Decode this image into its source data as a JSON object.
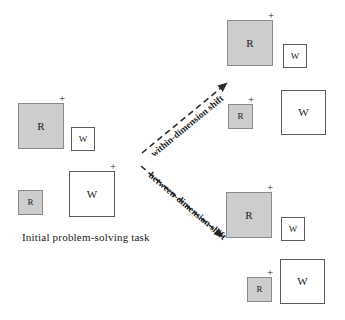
{
  "figure": {
    "width": 345,
    "height": 320,
    "background": "#ffffff",
    "fill_color": "#cdcdcd",
    "fill_border_color": "#8a8a8a",
    "open_border_color": "#5c5c5c",
    "arrow_color": "#2b2b2b"
  },
  "caption": {
    "initial_task": "Initial problem-solving task"
  },
  "arrows": {
    "within": {
      "label": "within-dimension shift",
      "x1": 142,
      "y1": 153,
      "x2": 227,
      "y2": 83,
      "label_x": 152,
      "label_y": 150,
      "label_angle": -39.5
    },
    "between": {
      "label": "between-dimension shift",
      "x1": 141,
      "y1": 166,
      "x2": 223,
      "y2": 237,
      "label_x": 150,
      "label_y": 169,
      "label_angle": 40.5
    }
  },
  "groups": [
    {
      "id": "initial-task",
      "name": "initial-problem-solving-task",
      "shapes": [
        {
          "id": "initial-large-r",
          "letter": "R",
          "fill": "filled",
          "size": "big",
          "x": 18,
          "y": 103,
          "w": 46,
          "h": 46,
          "plus": true,
          "plus_x": 59,
          "plus_y": 93
        },
        {
          "id": "initial-small-w",
          "letter": "W",
          "fill": "open",
          "size": "small",
          "x": 71,
          "y": 127,
          "w": 24,
          "h": 24,
          "plus": false,
          "plus_x": 0,
          "plus_y": 0
        },
        {
          "id": "initial-small-r",
          "letter": "R",
          "fill": "filled",
          "size": "small",
          "x": 18,
          "y": 190,
          "w": 25,
          "h": 25,
          "plus": false,
          "plus_x": 0,
          "plus_y": 0
        },
        {
          "id": "initial-large-w",
          "letter": "W",
          "fill": "open",
          "size": "big",
          "x": 69,
          "y": 171,
          "w": 46,
          "h": 46,
          "plus": true,
          "plus_x": 110,
          "plus_y": 161
        }
      ]
    },
    {
      "id": "within-shift",
      "name": "within-dimension-shift-outcome",
      "shapes": [
        {
          "id": "within-large-r",
          "letter": "R",
          "fill": "filled",
          "size": "big",
          "x": 227,
          "y": 20,
          "w": 46,
          "h": 46,
          "plus": true,
          "plus_x": 268,
          "plus_y": 10
        },
        {
          "id": "within-small-w",
          "letter": "W",
          "fill": "open",
          "size": "small",
          "x": 283,
          "y": 44,
          "w": 24,
          "h": 24,
          "plus": false,
          "plus_x": 0,
          "plus_y": 0
        },
        {
          "id": "within-small-r",
          "letter": "R",
          "fill": "filled",
          "size": "small",
          "x": 228,
          "y": 104,
          "w": 25,
          "h": 25,
          "plus": true,
          "plus_x": 248,
          "plus_y": 94
        },
        {
          "id": "within-large-w",
          "letter": "W",
          "fill": "open",
          "size": "big",
          "x": 281,
          "y": 90,
          "w": 45,
          "h": 45,
          "plus": false,
          "plus_x": 0,
          "plus_y": 0
        }
      ]
    },
    {
      "id": "between-shift",
      "name": "between-dimension-shift-outcome",
      "shapes": [
        {
          "id": "between-large-r",
          "letter": "R",
          "fill": "filled",
          "size": "big",
          "x": 226,
          "y": 192,
          "w": 46,
          "h": 46,
          "plus": true,
          "plus_x": 267,
          "plus_y": 182
        },
        {
          "id": "between-small-w",
          "letter": "W",
          "fill": "open",
          "size": "small",
          "x": 281,
          "y": 217,
          "w": 24,
          "h": 24,
          "plus": false,
          "plus_x": 0,
          "plus_y": 0
        },
        {
          "id": "between-small-r",
          "letter": "R",
          "fill": "filled",
          "size": "small",
          "x": 247,
          "y": 277,
          "w": 25,
          "h": 25,
          "plus": true,
          "plus_x": 267,
          "plus_y": 267
        },
        {
          "id": "between-large-w",
          "letter": "W",
          "fill": "open",
          "size": "big",
          "x": 280,
          "y": 259,
          "w": 45,
          "h": 45,
          "plus": false,
          "plus_x": 0,
          "plus_y": 0
        }
      ]
    }
  ]
}
